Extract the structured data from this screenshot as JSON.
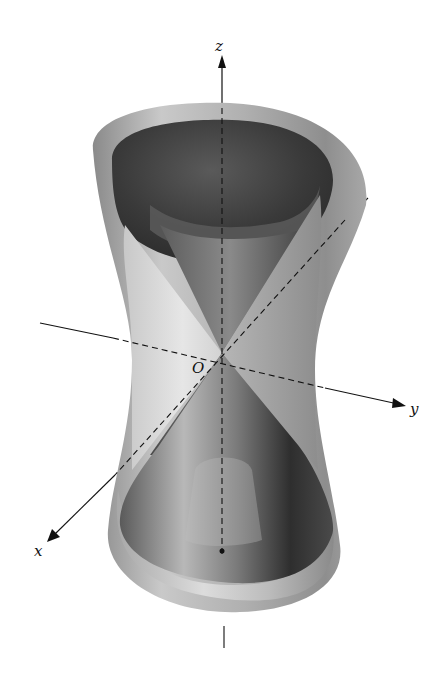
{
  "figure": {
    "labels": {
      "z_axis": "z",
      "y_axis": "y",
      "x_axis": "x",
      "origin": "O"
    },
    "colors": {
      "background": "#ffffff",
      "surface_light": "#d8d8d8",
      "surface_mid": "#9a9a9a",
      "surface_dark": "#3a3a3a",
      "axis": "#111111"
    }
  }
}
